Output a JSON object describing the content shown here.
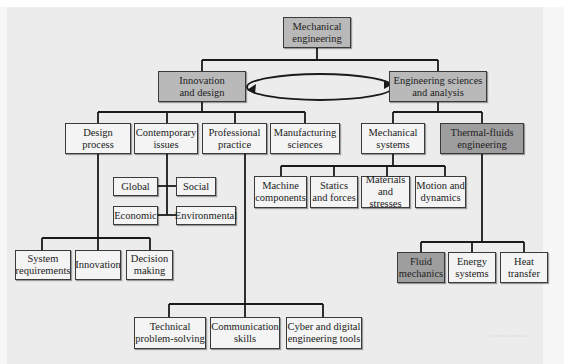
{
  "diagram": {
    "root": {
      "label": "Mechanical\nengineering",
      "shade": "mid"
    },
    "branches": [
      {
        "label": "Innovation\nand design",
        "shade": "mid",
        "children": [
          {
            "label": "Design\nprocess",
            "children": [
              {
                "label": "System\nrequirements"
              },
              {
                "label": "Innovation"
              },
              {
                "label": "Decision\nmaking"
              }
            ]
          },
          {
            "label": "Contemporary\nissues",
            "children": [
              {
                "label": "Global"
              },
              {
                "label": "Social"
              },
              {
                "label": "Economic"
              },
              {
                "label": "Environmental"
              }
            ]
          },
          {
            "label": "Professional\npractice",
            "children": [
              {
                "label": "Technical\nproblem-solving"
              },
              {
                "label": "Communication\nskills"
              },
              {
                "label": "Cyber and digital\nengineering tools"
              }
            ]
          },
          {
            "label": "Manufacturing\nsciences"
          }
        ]
      },
      {
        "label": "Engineering sciences\nand analysis",
        "shade": "mid",
        "children": [
          {
            "label": "Mechanical\nsystems",
            "children": [
              {
                "label": "Machine\ncomponents"
              },
              {
                "label": "Statics\nand forces"
              },
              {
                "label": "Materials\nand stresses"
              },
              {
                "label": "Motion and\ndynamics"
              }
            ]
          },
          {
            "label": "Thermal-fluids\nengineering",
            "shade": "dark",
            "children": [
              {
                "label": "Fluid\nmechanics",
                "shade": "dark"
              },
              {
                "label": "Energy\nsystems"
              },
              {
                "label": "Heat\ntransfer"
              }
            ]
          }
        ]
      }
    ],
    "connector": "bidirectional-elliptical-arrow between Innovation and design and Engineering sciences and analysis"
  },
  "colors": {
    "background": "#ececec",
    "box_light": "#f4f4f4",
    "box_mid": "#b9b9b9",
    "box_dark": "#9e9e9e",
    "line": "#1a1a1a"
  }
}
